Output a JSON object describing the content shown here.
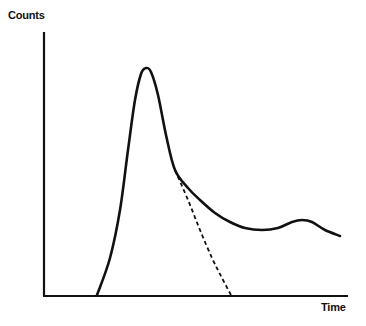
{
  "chart_data": {
    "type": "line",
    "title": "",
    "xlabel": "Time",
    "ylabel": "Counts",
    "grid": false,
    "legend": null,
    "ticks": {
      "x": [],
      "y": []
    },
    "series": [
      {
        "name": "measured",
        "style": "solid",
        "description": "Sharp rise from baseline to main peak, then decay to a trough, followed by a small secondary hump and slight fall-off",
        "points_px": [
          [
            97,
            295
          ],
          [
            110,
            258
          ],
          [
            120,
            210
          ],
          [
            128,
            150
          ],
          [
            135,
            100
          ],
          [
            141,
            74
          ],
          [
            146,
            68
          ],
          [
            151,
            72
          ],
          [
            158,
            95
          ],
          [
            166,
            135
          ],
          [
            175,
            170
          ],
          [
            188,
            188
          ],
          [
            200,
            200
          ],
          [
            215,
            213
          ],
          [
            230,
            222
          ],
          [
            245,
            228
          ],
          [
            262,
            230
          ],
          [
            278,
            228
          ],
          [
            292,
            222
          ],
          [
            302,
            220
          ],
          [
            312,
            222
          ],
          [
            325,
            230
          ],
          [
            340,
            236
          ]
        ],
        "relative_values": [
          0,
          0.16,
          0.37,
          0.63,
          0.85,
          0.97,
          1.0,
          0.98,
          0.88,
          0.71,
          0.55,
          0.47,
          0.42,
          0.36,
          0.32,
          0.29,
          0.29,
          0.29,
          0.32,
          0.33,
          0.32,
          0.29,
          0.26
        ]
      },
      {
        "name": "extrapolated decay",
        "style": "dashed",
        "description": "Dashed continuation branching from the main peak's falling edge down to the baseline",
        "points_px": [
          [
            175,
            170
          ],
          [
            188,
            200
          ],
          [
            200,
            230
          ],
          [
            212,
            258
          ],
          [
            222,
            278
          ],
          [
            231,
            295
          ]
        ],
        "relative_values": [
          0.55,
          0.42,
          0.29,
          0.16,
          0.07,
          0
        ]
      }
    ],
    "axis_px": {
      "origin": [
        44,
        296
      ],
      "y_top": [
        44,
        32
      ],
      "x_right": [
        348,
        296
      ]
    }
  },
  "labels": {
    "y_axis": "Counts",
    "x_axis": "Time"
  }
}
